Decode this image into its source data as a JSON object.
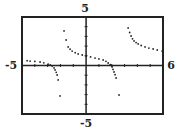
{
  "chart_data": {
    "type": "scatter",
    "title": "",
    "xlabel": "",
    "ylabel": "",
    "xlim": [
      -5,
      6
    ],
    "ylim": [
      -5,
      5
    ],
    "xtick_step": 1,
    "ytick_step": 1,
    "grid": false,
    "axis_labels": {
      "xmin": "-5",
      "xmax": "6",
      "ymin": "-5",
      "ymax": "5"
    },
    "series": [
      {
        "name": "branch-left",
        "points": [
          [
            -5.0,
            0.57
          ],
          [
            -4.6,
            0.5
          ],
          [
            -4.37,
            0.46
          ],
          [
            -4.0,
            0.42
          ],
          [
            -3.59,
            0.36
          ],
          [
            -3.3,
            0.28
          ],
          [
            -2.96,
            0.15
          ],
          [
            -2.8,
            0.05
          ],
          [
            -2.65,
            -0.05
          ],
          [
            -2.5,
            -0.25
          ],
          [
            -2.42,
            -0.46
          ],
          [
            -2.33,
            -0.7
          ],
          [
            -2.26,
            -0.98
          ],
          [
            -2.18,
            -1.49
          ],
          [
            -2.03,
            -3.14
          ]
        ]
      },
      {
        "name": "branch-middle",
        "points": [
          [
            -1.72,
            3.56
          ],
          [
            -1.56,
            2.63
          ],
          [
            -1.4,
            1.91
          ],
          [
            -1.25,
            1.68
          ],
          [
            -1.09,
            1.49
          ],
          [
            -0.85,
            1.32
          ],
          [
            -0.62,
            1.19
          ],
          [
            -0.3,
            1.08
          ],
          [
            0.0,
            0.98
          ],
          [
            0.35,
            0.88
          ],
          [
            0.7,
            0.77
          ],
          [
            1.0,
            0.68
          ],
          [
            1.33,
            0.57
          ],
          [
            1.55,
            0.43
          ],
          [
            1.72,
            0.26
          ],
          [
            1.88,
            0.08
          ],
          [
            2.03,
            -0.15
          ],
          [
            2.1,
            -0.4
          ],
          [
            2.18,
            -0.67
          ],
          [
            2.26,
            -0.95
          ],
          [
            2.34,
            -1.29
          ],
          [
            2.57,
            -3.04
          ]
        ]
      },
      {
        "name": "branch-right",
        "points": [
          [
            3.28,
            3.87
          ],
          [
            3.4,
            3.4
          ],
          [
            3.51,
            3.04
          ],
          [
            3.62,
            2.75
          ],
          [
            3.74,
            2.53
          ],
          [
            3.9,
            2.36
          ],
          [
            4.06,
            2.22
          ],
          [
            4.3,
            2.06
          ],
          [
            4.6,
            1.91
          ],
          [
            4.9,
            1.8
          ],
          [
            5.23,
            1.7
          ],
          [
            5.55,
            1.6
          ],
          [
            5.93,
            1.49
          ]
        ]
      }
    ],
    "color": "#222222"
  }
}
